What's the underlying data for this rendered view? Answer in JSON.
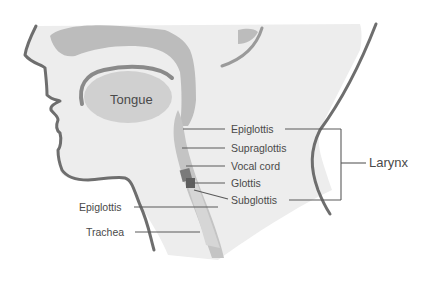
{
  "labels": {
    "tongue": "Tongue",
    "epiglottis_right": "Epiglottis",
    "supraglottis": "Supraglottis",
    "vocal_cord": "Vocal cord",
    "glottis": "Glottis",
    "subglottis": "Subglottis",
    "larynx": "Larynx",
    "epiglottis_left": "Epiglottis",
    "trachea": "Trachea"
  },
  "colors": {
    "skin_fill": "#ececec",
    "cavity_shade": "#b9b9b9",
    "tongue_fill": "#cfcfcf",
    "airway_dark": "#9a9a9a",
    "outline": "#6e6e6e",
    "text": "#4a4a4a"
  }
}
